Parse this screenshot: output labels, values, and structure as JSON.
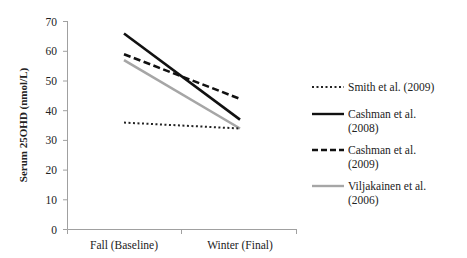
{
  "chart_data": {
    "type": "line",
    "title": "",
    "xlabel": "",
    "ylabel": "Serum 25OHD (nmol/L)",
    "categories": [
      "Fall (Baseline)",
      "Winter (Final)"
    ],
    "ylim": [
      0,
      70
    ],
    "yticks": [
      0,
      10,
      20,
      30,
      40,
      50,
      60,
      70
    ],
    "grid": false,
    "legend_position": "right",
    "series": [
      {
        "name": "Smith et al. (2009)",
        "values": [
          36,
          34
        ],
        "style": "dotted",
        "color": "#222222"
      },
      {
        "name": "Cashman et al. (2008)",
        "values": [
          66,
          37
        ],
        "style": "solid",
        "color": "#111111"
      },
      {
        "name": "Cashman et al. (2009)",
        "values": [
          59,
          44
        ],
        "style": "dashed",
        "color": "#111111"
      },
      {
        "name": "Viljakainen et al. (2006)",
        "values": [
          57,
          34
        ],
        "style": "solid",
        "color": "#a6a6a6"
      }
    ]
  },
  "legend": {
    "items": [
      {
        "line1": "Smith et al. (2009)",
        "line2": ""
      },
      {
        "line1": "Cashman et al.",
        "line2": "(2008)"
      },
      {
        "line1": "Cashman et al.",
        "line2": "(2009)"
      },
      {
        "line1": "Viljakainen et al.",
        "line2": "(2006)"
      }
    ]
  },
  "axis": {
    "y_title": "Serum 25OHD (nmol/L)",
    "y_tick_labels": [
      "0",
      "10",
      "20",
      "30",
      "40",
      "50",
      "60",
      "70"
    ],
    "x_tick_labels": [
      "Fall (Baseline)",
      "Winter (Final)"
    ]
  }
}
